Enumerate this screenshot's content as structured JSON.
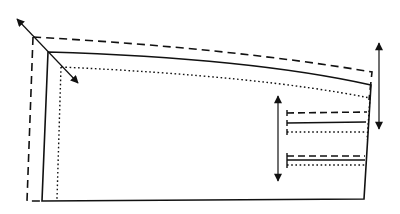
{
  "diagram": {
    "description": "Pattern adjustment diagram: three nested outlines (dashed, solid, dotted) with a curved top edge, diagonal and vertical double-headed adjustment arrows, and short horizontal reference lines at the right side.",
    "colors": {
      "line": "#111111",
      "background": "#ffffff"
    },
    "outlines": [
      {
        "name": "dashed-outline",
        "style": "dashed"
      },
      {
        "name": "solid-outline",
        "style": "solid"
      },
      {
        "name": "dotted-outline",
        "style": "dotted"
      }
    ],
    "arrows": [
      {
        "name": "diagonal-double-arrow",
        "type": "double-headed",
        "direction": "diagonal"
      },
      {
        "name": "right-vertical-double-arrow",
        "type": "double-headed",
        "direction": "vertical"
      },
      {
        "name": "inner-vertical-double-arrow",
        "type": "double-headed",
        "direction": "vertical"
      }
    ],
    "reference_lines": {
      "upper_group": [
        "dashed",
        "solid",
        "dotted"
      ],
      "lower_group": [
        "dashed",
        "solid",
        "dotted"
      ]
    }
  }
}
